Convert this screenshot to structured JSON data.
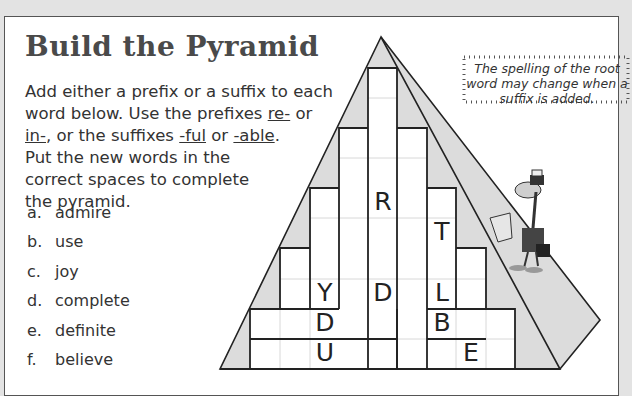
{
  "title": "Build the Pyramid",
  "instructions": {
    "line1_parts": [
      "Add either a prefix or a suffix to each word below.  Use the prefixes ",
      "re-",
      " or ",
      "in-",
      ", or the suffixes ",
      "-ful",
      " or ",
      "-able",
      "."
    ],
    "line2": "Put the new words in the correct spaces to complete the pyramid."
  },
  "words": [
    {
      "letter": "a.",
      "word": "admire"
    },
    {
      "letter": "b.",
      "word": "use"
    },
    {
      "letter": "c.",
      "word": "joy"
    },
    {
      "letter": "d.",
      "word": "complete"
    },
    {
      "letter": "e.",
      "word": "definite"
    },
    {
      "letter": "f.",
      "word": "believe"
    }
  ],
  "note": "The spelling of the root word may change when a suffix is added.",
  "pyramid_letters": [
    {
      "char": "R",
      "col": 5,
      "row": 4
    },
    {
      "char": "T",
      "col": 7,
      "row": 5
    },
    {
      "char": "Y",
      "col": 3,
      "row": 7
    },
    {
      "char": "D",
      "col": 5,
      "row": 7
    },
    {
      "char": "L",
      "col": 7,
      "row": 7
    },
    {
      "char": "D",
      "col": 3,
      "row": 8
    },
    {
      "char": "B",
      "col": 7,
      "row": 8
    },
    {
      "char": "U",
      "col": 3,
      "row": 9
    },
    {
      "char": "E",
      "col": 8,
      "row": 9
    }
  ],
  "colors": {
    "shade": "#dcdcdc",
    "line": "#222222",
    "grid": "#d8d8d8",
    "background": "#e3e3e3"
  }
}
